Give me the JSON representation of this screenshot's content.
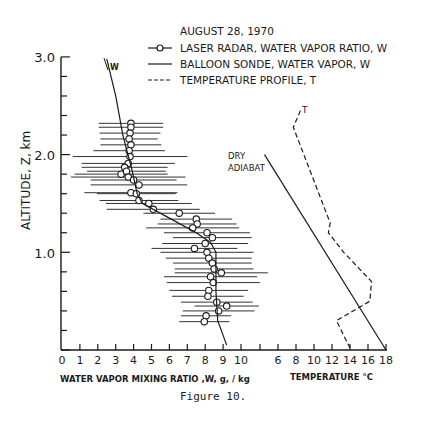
{
  "figure": {
    "caption": "Figure 10."
  },
  "legend": {
    "title": "AUGUST 28, 1970",
    "items": [
      {
        "symbol": "line-circle",
        "label": "LASER RADAR, WATER VAPOR RATIO, W"
      },
      {
        "symbol": "solid-line",
        "label": "BALLOON SONDE, WATER VAPOR, W"
      },
      {
        "symbol": "dashed-line",
        "label": "TEMPERATURE PROFILE, T"
      }
    ]
  },
  "annotations": {
    "w_label": "W",
    "t_label": "T",
    "dry_adiabat_line1": "DRY",
    "dry_adiabat_line2": "ADIABAT"
  },
  "axes": {
    "y_label": "ALTITUDE, Z, km",
    "y_ticks": [
      "3.0",
      "2.0",
      "1.0"
    ],
    "x1_label": "WATER VAPOR MIXING RATIO ,W, g, / kg",
    "x1_ticks": [
      "0",
      "1",
      "2",
      "3",
      "4",
      "5",
      "6",
      "7",
      "8",
      "9",
      "10"
    ],
    "x2_label": "TEMPERATURE °C",
    "x2_ticks": [
      "6",
      "8",
      "10",
      "12",
      "14",
      "16",
      "18"
    ]
  },
  "chart_data": {
    "type": "scatter",
    "title": "AUGUST 28, 1970",
    "xlabel": "WATER VAPOR MIXING RATIO, W, g/kg  |  TEMPERATURE °C",
    "ylabel": "ALTITUDE, Z, km",
    "ylim": [
      0,
      3.0
    ],
    "xlim_mixing_ratio": [
      0,
      10
    ],
    "xlim_temperature": [
      4,
      18
    ],
    "grid": false,
    "legend_position": "top-right",
    "series": [
      {
        "name": "LASER RADAR, WATER VAPOR RATIO, W",
        "style": "circles with horizontal error bars",
        "points": [
          {
            "W": 3.85,
            "Z": 2.32,
            "err": 1.8
          },
          {
            "W": 3.85,
            "Z": 2.28,
            "err": 1.8
          },
          {
            "W": 3.8,
            "Z": 2.22,
            "err": 1.7
          },
          {
            "W": 3.75,
            "Z": 2.16,
            "err": 1.6
          },
          {
            "W": 3.85,
            "Z": 2.1,
            "err": 1.7
          },
          {
            "W": 3.75,
            "Z": 2.04,
            "err": 2.0
          },
          {
            "W": 3.8,
            "Z": 1.98,
            "err": 3.2
          },
          {
            "W": 3.7,
            "Z": 1.91,
            "err": 2.6
          },
          {
            "W": 3.5,
            "Z": 1.87,
            "err": 2.4
          },
          {
            "W": 3.3,
            "Z": 1.8,
            "err": 2.6
          },
          {
            "W": 3.6,
            "Z": 1.83,
            "err": 2.2
          },
          {
            "W": 3.7,
            "Z": 1.77,
            "err": 3.2
          },
          {
            "W": 4.0,
            "Z": 1.74,
            "err": 2.4
          },
          {
            "W": 4.3,
            "Z": 1.69,
            "err": 2.7
          },
          {
            "W": 3.85,
            "Z": 1.61,
            "err": 2.6
          },
          {
            "W": 4.15,
            "Z": 1.6,
            "err": 2.2
          },
          {
            "W": 4.3,
            "Z": 1.53,
            "err": 2.2
          },
          {
            "W": 4.85,
            "Z": 1.5,
            "err": 2.4
          },
          {
            "W": 5.1,
            "Z": 1.44,
            "err": 2.6
          },
          {
            "W": 6.55,
            "Z": 1.4,
            "err": 2.0
          },
          {
            "W": 7.5,
            "Z": 1.34,
            "err": 2.0
          },
          {
            "W": 7.55,
            "Z": 1.29,
            "err": 2.2
          },
          {
            "W": 7.3,
            "Z": 1.25,
            "err": 2.6
          },
          {
            "W": 8.1,
            "Z": 1.2,
            "err": 2.4
          },
          {
            "W": 8.4,
            "Z": 1.15,
            "err": 2.2
          },
          {
            "W": 8.0,
            "Z": 1.09,
            "err": 2.4
          },
          {
            "W": 7.4,
            "Z": 1.04,
            "err": 2.4
          },
          {
            "W": 8.1,
            "Z": 1.0,
            "err": 2.6
          },
          {
            "W": 8.2,
            "Z": 0.94,
            "err": 2.4
          },
          {
            "W": 8.4,
            "Z": 0.89,
            "err": 2.2
          },
          {
            "W": 8.5,
            "Z": 0.83,
            "err": 2.2
          },
          {
            "W": 8.9,
            "Z": 0.79,
            "err": 2.6
          },
          {
            "W": 8.3,
            "Z": 0.75,
            "err": 2.6
          },
          {
            "W": 8.45,
            "Z": 0.69,
            "err": 2.6
          },
          {
            "W": 8.2,
            "Z": 0.61,
            "err": 2.2
          },
          {
            "W": 8.15,
            "Z": 0.55,
            "err": 2.0
          },
          {
            "W": 8.65,
            "Z": 0.49,
            "err": 2.0
          },
          {
            "W": 9.2,
            "Z": 0.45,
            "err": 1.8
          },
          {
            "W": 8.75,
            "Z": 0.4,
            "err": 2.0
          },
          {
            "W": 8.05,
            "Z": 0.35,
            "err": 1.4
          },
          {
            "W": 7.95,
            "Z": 0.29,
            "err": 1.4
          }
        ]
      },
      {
        "name": "BALLOON SONDE, WATER VAPOR, W",
        "style": "solid line",
        "points": [
          {
            "W": 2.5,
            "Z": 2.98
          },
          {
            "W": 3.0,
            "Z": 2.6
          },
          {
            "W": 3.4,
            "Z": 2.2
          },
          {
            "W": 3.9,
            "Z": 1.85
          },
          {
            "W": 4.2,
            "Z": 1.6
          },
          {
            "W": 4.5,
            "Z": 1.5
          },
          {
            "W": 6.0,
            "Z": 1.35
          },
          {
            "W": 7.5,
            "Z": 1.2
          },
          {
            "W": 8.3,
            "Z": 1.1
          },
          {
            "W": 8.6,
            "Z": 1.0
          },
          {
            "W": 8.6,
            "Z": 0.6
          },
          {
            "W": 8.7,
            "Z": 0.3
          },
          {
            "W": 9.2,
            "Z": 0.05
          }
        ]
      },
      {
        "name": "DRY ADIABAT",
        "style": "solid line (temperature axis)",
        "points": [
          {
            "T": 4.5,
            "Z": 2.0
          },
          {
            "T": 18.0,
            "Z": 0.0
          }
        ]
      },
      {
        "name": "TEMPERATURE PROFILE, T",
        "style": "dashed line (temperature axis)",
        "points": [
          {
            "T": 8.5,
            "Z": 2.45
          },
          {
            "T": 7.7,
            "Z": 2.28
          },
          {
            "T": 11.8,
            "Z": 1.3
          },
          {
            "T": 11.6,
            "Z": 1.2
          },
          {
            "T": 13.3,
            "Z": 1.0
          },
          {
            "T": 16.4,
            "Z": 0.7
          },
          {
            "T": 16.2,
            "Z": 0.5
          },
          {
            "T": 12.5,
            "Z": 0.3
          },
          {
            "T": 14.0,
            "Z": 0.02
          }
        ]
      }
    ]
  }
}
